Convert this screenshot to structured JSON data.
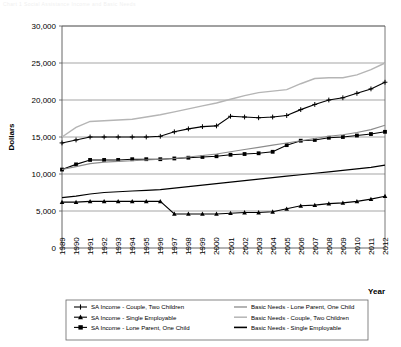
{
  "figure": {
    "faint_title": "Chart 1  Social Assistance Income and Basic Needs",
    "ylabel": "Dollars",
    "xlabel": "Year"
  },
  "axis": {
    "y_ticks": [
      "0",
      "5,000",
      "10,000",
      "15,000",
      "20,000",
      "25,000",
      "30,000"
    ],
    "x_ticks": [
      "1989",
      "1990",
      "1991",
      "1992",
      "1993",
      "1994",
      "1995",
      "1996",
      "1997",
      "1998",
      "1999",
      "2000",
      "2001",
      "2002",
      "2003",
      "2004",
      "2005",
      "2006",
      "2007",
      "2008",
      "2009",
      "2010",
      "2011",
      "2012"
    ]
  },
  "colors": {
    "sa_couple_two_children": "#000000",
    "sa_single_employable": "#000000",
    "sa_lone_parent_one_child": "#000000",
    "bn_lone_parent_one_child": "#8c8c8c",
    "bn_couple_two_children": "#b5b5b5",
    "bn_single_employable": "#000000",
    "gridline": "#808080",
    "axis": "#555555"
  },
  "legend": {
    "items": [
      {
        "label": "SA Income - Couple, Two Children",
        "marker": "plus-marker",
        "name": "legend-item-sa-couple-two-children"
      },
      {
        "label": "SA Income - Single Employable",
        "marker": "triangle-marker",
        "name": "legend-item-sa-single-employable"
      },
      {
        "label": "SA Income - Lone Parent, One Child",
        "marker": "square-marker",
        "name": "legend-item-sa-lone-parent-one-child"
      },
      {
        "label": "Basic Needs - Lone Parent, One Child",
        "marker": "line-marker-gray-mid",
        "name": "legend-item-bn-lone-parent-one-child"
      },
      {
        "label": "Basic Needs - Couple, Two Children",
        "marker": "line-marker-gray-light",
        "name": "legend-item-bn-couple-two-children"
      },
      {
        "label": "Basic Needs - Single Employable",
        "marker": "line-marker-black",
        "name": "legend-item-bn-single-employable"
      }
    ]
  },
  "chart_data": {
    "type": "line",
    "title": "Social Assistance Income and Basic Needs",
    "xlabel": "Year",
    "ylabel": "Dollars",
    "xlim": [
      1989,
      2012
    ],
    "ylim": [
      0,
      30000
    ],
    "ytick_step": 5000,
    "grid": true,
    "legend_position": "bottom",
    "x": [
      1989,
      1990,
      1991,
      1992,
      1993,
      1994,
      1995,
      1996,
      1997,
      1998,
      1999,
      2000,
      2001,
      2002,
      2003,
      2004,
      2005,
      2006,
      2007,
      2008,
      2009,
      2010,
      2011,
      2012
    ],
    "series": [
      {
        "name": "SA Income - Couple, Two Children",
        "marker": "plus",
        "color": "#000000",
        "values": [
          14200,
          14600,
          15000,
          15000,
          15000,
          15000,
          15000,
          15100,
          15700,
          16100,
          16400,
          16500,
          17800,
          17700,
          17600,
          17700,
          17900,
          18700,
          19400,
          20000,
          20300,
          20900,
          21500,
          22400
        ]
      },
      {
        "name": "SA Income - Single Employable",
        "marker": "triangle",
        "color": "#000000",
        "values": [
          6200,
          6200,
          6300,
          6300,
          6300,
          6300,
          6300,
          6300,
          4600,
          4600,
          4600,
          4600,
          4700,
          4800,
          4800,
          4900,
          5300,
          5700,
          5800,
          6000,
          6100,
          6300,
          6600,
          7000
        ]
      },
      {
        "name": "SA Income - Lone Parent, One Child",
        "marker": "square",
        "color": "#000000",
        "values": [
          10600,
          11300,
          11900,
          11900,
          11900,
          12000,
          12000,
          12000,
          12100,
          12200,
          12300,
          12400,
          12600,
          12700,
          12800,
          13000,
          13900,
          14500,
          14600,
          14900,
          15000,
          15200,
          15400,
          15700
        ]
      },
      {
        "name": "Basic Needs - Lone Parent, One Child",
        "marker": "none",
        "color": "#8c8c8c",
        "values": [
          10600,
          11000,
          11400,
          11600,
          11700,
          11800,
          11900,
          12000,
          12100,
          12300,
          12500,
          12700,
          13000,
          13300,
          13600,
          13900,
          14200,
          14500,
          14800,
          15100,
          15300,
          15600,
          16000,
          16600
        ]
      },
      {
        "name": "Basic Needs - Couple, Two Children",
        "marker": "none",
        "color": "#b5b5b5",
        "values": [
          15000,
          16300,
          17100,
          17200,
          17300,
          17400,
          17700,
          18000,
          18400,
          18800,
          19200,
          19600,
          20100,
          20600,
          21000,
          21200,
          21400,
          22200,
          22900,
          23000,
          23000,
          23400,
          24100,
          25000
        ]
      },
      {
        "name": "Basic Needs - Single Employable",
        "marker": "none",
        "color": "#000000",
        "values": [
          6800,
          7000,
          7300,
          7500,
          7600,
          7700,
          7800,
          7900,
          8100,
          8300,
          8500,
          8700,
          8900,
          9100,
          9300,
          9500,
          9700,
          9900,
          10100,
          10300,
          10500,
          10700,
          10900,
          11200
        ]
      }
    ]
  }
}
